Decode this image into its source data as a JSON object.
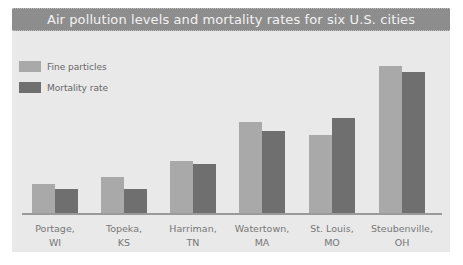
{
  "chart_data": {
    "type": "bar",
    "title": "Air pollution levels and mortality rates for six U.S. cities",
    "categories": [
      "Portage, WI",
      "Topeka, KS",
      "Harriman, TN",
      "Watertown, MA",
      "St. Louis, MO",
      "Steubenville, OH"
    ],
    "category_lines": [
      [
        "Portage,",
        "WI"
      ],
      [
        "Topeka,",
        "KS"
      ],
      [
        "Harriman,",
        "TN"
      ],
      [
        "Watertown,",
        "MA"
      ],
      [
        "St. Louis,",
        "MO"
      ],
      [
        "Steubenville,",
        "OH"
      ]
    ],
    "series": [
      {
        "name": "Fine particles",
        "color": "#a9a9a9",
        "values": [
          29,
          36,
          52,
          91,
          78,
          147
        ]
      },
      {
        "name": "Mortality rate",
        "color": "#6f6f6f",
        "values": [
          24,
          24,
          49,
          82,
          95,
          141
        ]
      }
    ],
    "xlabel": "",
    "ylabel": "",
    "ylim": [
      0,
      150
    ],
    "grid": false,
    "legend_position": "top-left",
    "value_units": "relative (no axis shown)"
  }
}
